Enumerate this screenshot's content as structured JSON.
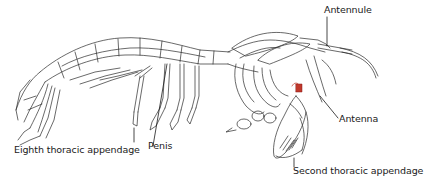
{
  "diagram": {
    "line_color": "#2a2a2a",
    "accent_color": "#c0392b",
    "labels": [
      {
        "id": "antennule",
        "text": "Antennule"
      },
      {
        "id": "antenna",
        "text": "Antenna"
      },
      {
        "id": "eighth-thoracic-appendage",
        "text": "Eighth thoracic appendage"
      },
      {
        "id": "penis",
        "text": "Penis"
      },
      {
        "id": "second-thoracic-appendage",
        "text": "Second thoracic appendage"
      }
    ]
  }
}
